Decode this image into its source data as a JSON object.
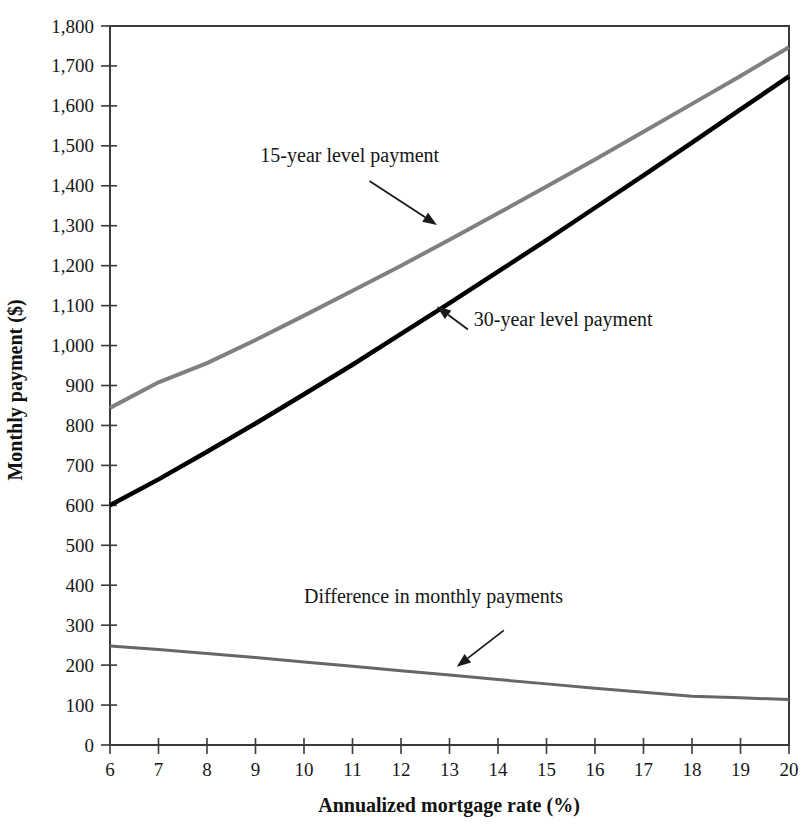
{
  "chart_data": {
    "type": "line",
    "title": "",
    "subtitle": "",
    "xlabel": "Annualized mortgage rate (%)",
    "ylabel": "Monthly payment ($)",
    "xlim": [
      6,
      20
    ],
    "ylim": [
      0,
      1800
    ],
    "grid": false,
    "legend_position": "none",
    "xtick_labels": [
      "6",
      "7",
      "8",
      "9",
      "10",
      "11",
      "12",
      "13",
      "14",
      "15",
      "16",
      "17",
      "18",
      "19",
      "20"
    ],
    "ytick_labels": [
      "0",
      "100",
      "200",
      "300",
      "400",
      "500",
      "600",
      "700",
      "800",
      "900",
      "1,000",
      "1,100",
      "1,200",
      "1,300",
      "1,400",
      "1,500",
      "1,600",
      "1,700",
      "1,800"
    ],
    "xticks": [
      6,
      7,
      8,
      9,
      10,
      11,
      12,
      13,
      14,
      15,
      16,
      17,
      18,
      19,
      20
    ],
    "yticks": [
      0,
      100,
      200,
      300,
      400,
      500,
      600,
      700,
      800,
      900,
      1000,
      1100,
      1200,
      1300,
      1400,
      1500,
      1600,
      1700,
      1800
    ],
    "x": [
      6,
      7,
      8,
      9,
      10,
      11,
      12,
      13,
      14,
      15,
      16,
      17,
      18,
      19,
      20
    ],
    "series": [
      {
        "name": "15-year level payment",
        "color": "#808080",
        "width": 4,
        "values": [
          844,
          908,
          956,
          1014,
          1075,
          1137,
          1200,
          1265,
          1331,
          1398,
          1466,
          1535,
          1605,
          1675,
          1747
        ]
      },
      {
        "name": "30-year level payment",
        "color": "#000000",
        "width": 4.5,
        "values": [
          600,
          665,
          734,
          805,
          878,
          952,
          1029,
          1106,
          1185,
          1264,
          1345,
          1426,
          1508,
          1591,
          1674
        ]
      },
      {
        "name": "Difference in monthly payments",
        "color": "#666666",
        "width": 3,
        "values": [
          248,
          239,
          229,
          219,
          208,
          197,
          186,
          175,
          164,
          153,
          142,
          132,
          122,
          118,
          114
        ]
      }
    ],
    "annotations": [
      {
        "text": "15-year level payment",
        "label_x": 9.1,
        "label_y": 1460,
        "tip_x": 12.74,
        "tip_y": 1302,
        "tail_x": 11.35,
        "tail_y": 1412
      },
      {
        "text": "30-year level payment",
        "label_x": 13.5,
        "label_y": 1050,
        "tip_x": 12.74,
        "tip_y": 1098,
        "tail_x": 13.38,
        "tail_y": 1040
      },
      {
        "text": "Difference in monthly payments",
        "label_x": 10.0,
        "label_y": 355,
        "tip_x": 13.15,
        "tip_y": 196,
        "tail_x": 14.12,
        "tail_y": 287
      }
    ]
  }
}
